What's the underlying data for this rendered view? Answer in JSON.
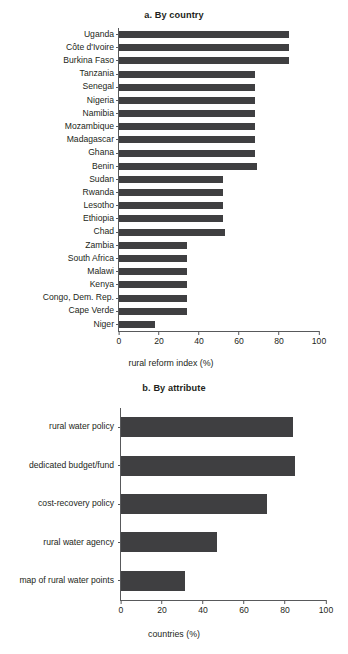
{
  "figure": {
    "background": "#ffffff",
    "bar_color": "#3f3f41",
    "axis_color": "#58595b",
    "text_color": "#231f20"
  },
  "chart_data": [
    {
      "id": "a",
      "type": "bar",
      "orientation": "horizontal",
      "title": "a. By country",
      "xlabel": "rural reform index (%)",
      "ylabel": "",
      "xlim": [
        0,
        100
      ],
      "xticks": [
        0,
        20,
        40,
        60,
        80,
        100
      ],
      "xticklabels": [
        "0",
        "20",
        "40",
        "60",
        "80",
        "100"
      ],
      "grid": false,
      "legend": false,
      "categories": [
        "Uganda",
        "Côte d'Ivoire",
        "Burkina Faso",
        "Tanzania",
        "Senegal",
        "Nigeria",
        "Namibia",
        "Mozambique",
        "Madagascar",
        "Ghana",
        "Benin",
        "Sudan",
        "Rwanda",
        "Lesotho",
        "Ethiopia",
        "Chad",
        "Zambia",
        "South Africa",
        "Malawi",
        "Kenya",
        "Congo, Dem. Rep.",
        "Cape Verde",
        "Niger"
      ],
      "values": [
        85,
        85,
        85,
        68,
        68,
        68,
        68,
        68,
        68,
        68,
        69,
        52,
        52,
        52,
        52,
        53,
        34,
        34,
        34,
        34,
        34,
        34,
        18
      ]
    },
    {
      "id": "b",
      "type": "bar",
      "orientation": "horizontal",
      "title": "b. By attribute",
      "xlabel": "countries (%)",
      "ylabel": "",
      "xlim": [
        0,
        100
      ],
      "xticks": [
        0,
        20,
        40,
        60,
        80,
        100
      ],
      "xticklabels": [
        "0",
        "20",
        "40",
        "60",
        "80",
        "100"
      ],
      "grid": false,
      "legend": false,
      "categories": [
        "rural water policy",
        "dedicated budget/fund",
        "cost-recovery policy",
        "rural water agency",
        "map of rural water points"
      ],
      "values": [
        84,
        85,
        71,
        47,
        31
      ]
    }
  ]
}
